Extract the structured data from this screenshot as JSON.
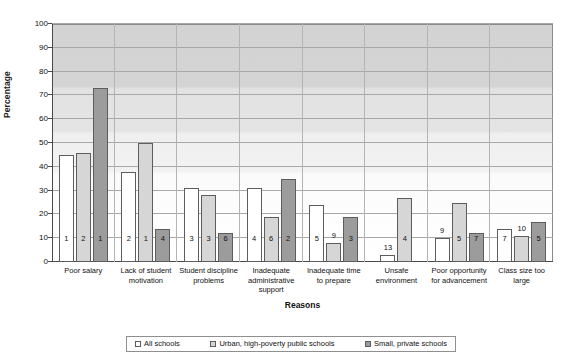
{
  "chart_data": {
    "type": "bar",
    "title": "",
    "xlabel": "Reasons",
    "ylabel": "Percentage",
    "ylim": [
      0,
      100
    ],
    "ytick_values": [
      0,
      10,
      20,
      30,
      40,
      50,
      60,
      70,
      80,
      90,
      100
    ],
    "ytick_labels": [
      "0",
      "10",
      "20",
      "30",
      "40",
      "50",
      "60",
      "70",
      "80",
      "90",
      "100"
    ],
    "grid": true,
    "legend_position": "bottom",
    "categories": [
      "Poor salary",
      "Lack of student motivation",
      "Student discipline problems",
      "Inadequate administrative support",
      "Inadequate time to prepare",
      "Unsafe environment",
      "Poor opportunity for advancement",
      "Class size too large"
    ],
    "series": [
      {
        "name": "All schools",
        "color": "#ffffff",
        "values": [
          45,
          38,
          31,
          31,
          24,
          3,
          10,
          14
        ],
        "rank_labels": [
          "1",
          "2",
          "3",
          "4",
          "5",
          "13",
          "9",
          "7"
        ]
      },
      {
        "name": "Urban, high-poverty public schools",
        "color": "#d6d6d6",
        "values": [
          46,
          50,
          28,
          19,
          8,
          27,
          25,
          11
        ],
        "rank_labels": [
          "2",
          "1",
          "3",
          "6",
          "9",
          "4",
          "5",
          "10"
        ]
      },
      {
        "name": "Small, private schools",
        "color": "#9c9c9c",
        "values": [
          73,
          14,
          12,
          35,
          19,
          null,
          12,
          17
        ],
        "rank_labels": [
          "1",
          "4",
          "6",
          "2",
          "3",
          null,
          "7",
          "5"
        ]
      }
    ]
  }
}
